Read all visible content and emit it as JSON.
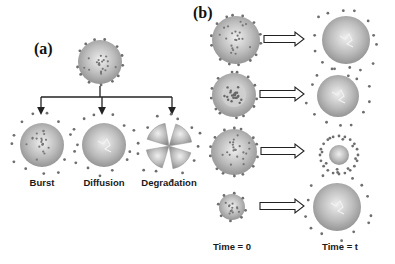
{
  "panels": {
    "a": {
      "label": "(a)",
      "source_sphere": {
        "cx": 100,
        "cy": 62,
        "r": 22,
        "type": "loaded"
      },
      "mechanisms": [
        {
          "label": "Burst",
          "cx": 42,
          "cy": 145,
          "r": 22,
          "type": "burst"
        },
        {
          "label": "Diffusion",
          "cx": 104,
          "cy": 145,
          "r": 22,
          "type": "diffusion"
        },
        {
          "label": "Degradation",
          "cx": 169,
          "cy": 146,
          "r": 23,
          "type": "degradation"
        }
      ]
    },
    "b": {
      "label": "(b)",
      "time_labels": {
        "start": "Time = 0",
        "end": "Time = t"
      },
      "rows": [
        {
          "left": {
            "cx": 236,
            "cy": 40,
            "r": 24,
            "type": "loaded"
          },
          "right": {
            "cx": 346,
            "cy": 40,
            "r": 24,
            "type": "released"
          }
        },
        {
          "left": {
            "cx": 234,
            "cy": 95,
            "r": 22,
            "type": "core"
          },
          "right": {
            "cx": 338,
            "cy": 96,
            "r": 21,
            "type": "released"
          }
        },
        {
          "left": {
            "cx": 234,
            "cy": 152,
            "r": 23,
            "type": "loaded"
          },
          "right": {
            "cx": 339,
            "cy": 155,
            "r": 10,
            "type": "shrunk"
          }
        },
        {
          "left": {
            "cx": 232,
            "cy": 207,
            "r": 13,
            "type": "loaded"
          },
          "right": {
            "cx": 337,
            "cy": 207,
            "r": 24,
            "type": "swollen"
          }
        }
      ]
    }
  },
  "colors": {
    "sphere_light": "#d9d9d9",
    "sphere_dark": "#8c8c8c",
    "dot": "#6e6e6e",
    "line": "#222222"
  }
}
